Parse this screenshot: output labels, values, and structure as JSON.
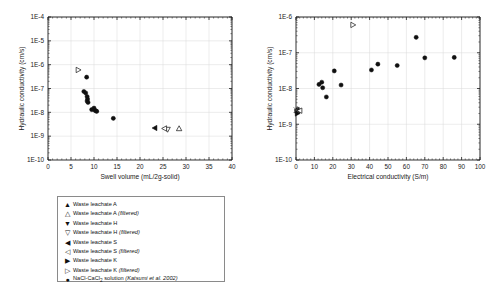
{
  "figure": {
    "panels": [
      "left",
      "right"
    ]
  },
  "chart_data": [
    {
      "id": "left",
      "type": "scatter",
      "title": "",
      "xlabel": "Swell volume (mL/2g-solid)",
      "ylabel": "Hydraulic conductivity (cm/s)",
      "xlim": [
        0,
        40
      ],
      "ylim": [
        1e-10,
        0.0001
      ],
      "yscale": "log",
      "xticks": [
        0,
        5,
        10,
        15,
        20,
        25,
        30,
        35,
        40
      ],
      "xticklabels": [
        "0",
        "5",
        "10",
        "15",
        "20",
        "25",
        "30",
        "35",
        "40"
      ],
      "yticks": [
        1e-10,
        1e-09,
        1e-08,
        1e-07,
        1e-06,
        1e-05,
        0.0001
      ],
      "yticklabels": [
        "1E-10",
        "1E-9",
        "1E-8",
        "1E-7",
        "1E-6",
        "1E-5",
        "1E-4"
      ],
      "grid": true,
      "legend_position": "below",
      "series": [
        {
          "name": "Waste leachate A",
          "marker": "triangle-up",
          "filled": true,
          "points": []
        },
        {
          "name": "Waste leachate A (filtered)",
          "marker": "triangle-up",
          "filled": false,
          "points": [
            [
              28.5,
              2.1e-09
            ]
          ]
        },
        {
          "name": "Waste leachate H",
          "marker": "triangle-down",
          "filled": true,
          "points": []
        },
        {
          "name": "Waste leachate H (filtered)",
          "marker": "triangle-down",
          "filled": false,
          "points": [
            [
              26.0,
              1.9e-09
            ]
          ]
        },
        {
          "name": "Waste leachate S",
          "marker": "triangle-left",
          "filled": true,
          "points": [
            [
              23.2,
              2.2e-09
            ]
          ]
        },
        {
          "name": "Waste leachate S (filtered)",
          "marker": "triangle-left",
          "filled": false,
          "points": [
            [
              25.3,
              2.1e-09
            ]
          ]
        },
        {
          "name": "Waste leachate K",
          "marker": "triangle-right",
          "filled": true,
          "points": []
        },
        {
          "name": "Waste leachate K (filtered)",
          "marker": "triangle-right",
          "filled": false,
          "points": [
            [
              6.6,
              6e-07
            ]
          ]
        },
        {
          "name": "NaCl-CaCl2 solution (Katsumi et al. 2002)",
          "marker": "circle",
          "filled": true,
          "points": [
            [
              8.4,
              3e-07
            ],
            [
              7.8,
              7.5e-08
            ],
            [
              8.2,
              6.5e-08
            ],
            [
              8.5,
              4.6e-08
            ],
            [
              8.6,
              3.6e-08
            ],
            [
              8.5,
              3e-08
            ],
            [
              8.7,
              2.6e-08
            ],
            [
              9.5,
              1.3e-08
            ],
            [
              10.1,
              1.25e-08
            ],
            [
              10.4,
              1.15e-08
            ],
            [
              10.6,
              1.1e-08
            ],
            [
              10.0,
              1.5e-08
            ],
            [
              14.2,
              5.6e-09
            ]
          ]
        }
      ]
    },
    {
      "id": "right",
      "type": "scatter",
      "title": "",
      "xlabel": "Electrical conductivity (S/m)",
      "ylabel": "Hydraulic conductivity (cm/s)",
      "xlim": [
        0,
        100
      ],
      "ylim": [
        1e-10,
        1e-06
      ],
      "yscale": "log",
      "xticks": [
        0,
        10,
        20,
        30,
        40,
        50,
        60,
        70,
        80,
        90,
        100
      ],
      "xticklabels": [
        "0",
        "10",
        "20",
        "30",
        "40",
        "50",
        "60",
        "70",
        "80",
        "90",
        "100"
      ],
      "yticks": [
        1e-10,
        1e-09,
        1e-08,
        1e-07,
        1e-06
      ],
      "yticklabels": [
        "1E-10",
        "1E-9",
        "1E-8",
        "1E-7",
        "1E-6"
      ],
      "grid": true,
      "legend_position": "below",
      "series": [
        {
          "name": "Waste leachate A",
          "marker": "triangle-up",
          "filled": true,
          "points": [
            [
              0.6,
              2.4e-09
            ]
          ]
        },
        {
          "name": "Waste leachate A (filtered)",
          "marker": "triangle-up",
          "filled": false,
          "points": [
            [
              0.9,
              2.6e-09
            ]
          ]
        },
        {
          "name": "Waste leachate H",
          "marker": "triangle-down",
          "filled": true,
          "points": [
            [
              0.7,
              2.2e-09
            ]
          ]
        },
        {
          "name": "Waste leachate H (filtered)",
          "marker": "triangle-down",
          "filled": false,
          "points": [
            [
              1.1,
              2.3e-09
            ]
          ]
        },
        {
          "name": "Waste leachate S",
          "marker": "triangle-left",
          "filled": true,
          "points": [
            [
              0.5,
              2.5e-09
            ]
          ]
        },
        {
          "name": "Waste leachate S (filtered)",
          "marker": "triangle-left",
          "filled": false,
          "points": [
            [
              2.0,
              2.4e-09
            ]
          ]
        },
        {
          "name": "Waste leachate K",
          "marker": "triangle-right",
          "filled": true,
          "points": [
            [
              0.8,
              2e-09
            ]
          ]
        },
        {
          "name": "Waste leachate K (filtered)",
          "marker": "triangle-right",
          "filled": false,
          "points": [
            [
              31.0,
              6e-07
            ]
          ]
        },
        {
          "name": "NaCl-CaCl2 solution (Katsumi et al. 2002)",
          "marker": "circle",
          "filled": true,
          "points": [
            [
              12.5,
              1.3e-08
            ],
            [
              14.0,
              1.5e-08
            ],
            [
              14.5,
              1.05e-08
            ],
            [
              16.5,
              5.8e-09
            ],
            [
              20.8,
              3.1e-08
            ],
            [
              24.5,
              1.25e-08
            ],
            [
              41.0,
              3.3e-08
            ],
            [
              44.5,
              4.8e-08
            ],
            [
              55.0,
              4.4e-08
            ],
            [
              65.3,
              2.7e-07
            ],
            [
              70.0,
              7.2e-08
            ],
            [
              86.0,
              7.4e-08
            ]
          ]
        },
        {
          "name": "Distilled water",
          "marker": "cross",
          "filled": false,
          "points": [
            [
              0.2,
              2.5e-09
            ]
          ]
        }
      ]
    }
  ],
  "legend_left": {
    "rows": [
      {
        "marker": "▲",
        "label": "Waste leachate A",
        "note": ""
      },
      {
        "marker": "△",
        "label": "Waste leachate A ",
        "note": "(filtered)"
      },
      {
        "marker": "▼",
        "label": "Waste leachate H",
        "note": ""
      },
      {
        "marker": "▽",
        "label": "Waste leachate H ",
        "note": "(filtered)"
      },
      {
        "marker": "◀",
        "label": "Waste leachate S",
        "note": ""
      },
      {
        "marker": "◁",
        "label": "Waste leachate S ",
        "note": "(filtered)"
      },
      {
        "marker": "▶",
        "label": "Waste leachate K",
        "note": ""
      },
      {
        "marker": "▷",
        "label": "Waste leachate K ",
        "note": "(filtered)"
      },
      {
        "marker": "●",
        "label": "NaCl-CaCl2 solution ",
        "note": "(Katsumi et al. 2002)"
      }
    ]
  },
  "legend_right": {
    "col1": [
      {
        "marker": "▲",
        "label": "Waste leachate A",
        "note": ""
      },
      {
        "marker": "▼",
        "label": "Waste leachate H",
        "note": ""
      },
      {
        "marker": "◀",
        "label": "Waste leachate S",
        "note": ""
      },
      {
        "marker": "▶",
        "label": "Waste leachate K",
        "note": ""
      },
      {
        "marker": "●",
        "label": "NaCl-CaCl2 solution ",
        "note": "(Katsumi et al. 2002)"
      },
      {
        "marker": "×",
        "label": "Distilled water",
        "note": ""
      }
    ],
    "col2": [
      {
        "marker": "△",
        "label": "Waste leachate A ",
        "note": "(filtered)"
      },
      {
        "marker": "▽",
        "label": "Waste leachate H ",
        "note": "(filtered)"
      },
      {
        "marker": "◁",
        "label": "Waste leachate S ",
        "note": "(filtered)"
      },
      {
        "marker": "▷",
        "label": "Waste leachate K ",
        "note": "(filtered)"
      }
    ]
  },
  "colors": {
    "marker": "#101010",
    "axis": "#1a1a1a",
    "grid": "#d8d8d8",
    "legend_border": "#8a8a8a",
    "background": "#ffffff"
  }
}
